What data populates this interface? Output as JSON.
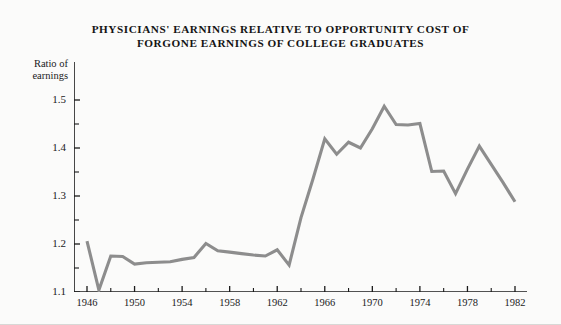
{
  "figure": {
    "background_color": "#fbfbfa",
    "line_color": "#8d8d8d",
    "axis_color": "#1a1a1a",
    "text_color": "#141414"
  },
  "title": "PHYSICIANS' EARNINGS RELATIVE TO OPPORTUNITY COST OF\nFORGONE EARNINGS OF COLLEGE GRADUATES",
  "y_axis_title": "Ratio of\nearnings",
  "y_ticks": [
    "1.1",
    "1.2",
    "1.3",
    "1.4",
    "1.5"
  ],
  "x_ticks": [
    "1946",
    "1950",
    "1954",
    "1958",
    "1962",
    "1966",
    "1970",
    "1974",
    "1978",
    "1982"
  ],
  "chart_data": {
    "type": "line",
    "title": "PHYSICIANS' EARNINGS RELATIVE TO OPPORTUNITY COST OF FORGONE EARNINGS OF COLLEGE GRADUATES",
    "subtitle": "",
    "xlabel": "",
    "ylabel": "Ratio of earnings",
    "xlim": [
      1945.5,
      1982.5
    ],
    "ylim": [
      1.1,
      1.53
    ],
    "grid": false,
    "legend": false,
    "y_major_ticks": [
      1.1,
      1.2,
      1.3,
      1.4,
      1.5
    ],
    "y_minor_ticks": [
      1.15,
      1.25,
      1.35,
      1.45
    ],
    "x_major_ticks": [
      1946,
      1950,
      1954,
      1958,
      1962,
      1966,
      1970,
      1974,
      1978,
      1982
    ],
    "x_minor_ticks": [
      1948,
      1952,
      1956,
      1960,
      1964,
      1968,
      1972,
      1976,
      1980
    ],
    "series": [
      {
        "name": "Ratio of physicians' earnings to opportunity cost",
        "color": "#8d8d8d",
        "x": [
          1946,
          1947,
          1948,
          1949,
          1950,
          1951,
          1952,
          1953,
          1954,
          1955,
          1956,
          1957,
          1958,
          1959,
          1960,
          1961,
          1962,
          1963,
          1964,
          1965,
          1966,
          1967,
          1968,
          1969,
          1970,
          1971,
          1972,
          1973,
          1974,
          1975,
          1976,
          1977,
          1978,
          1979,
          1980,
          1981,
          1982
        ],
        "values": [
          1.206,
          1.104,
          1.175,
          1.174,
          1.158,
          1.161,
          1.162,
          1.163,
          1.168,
          1.172,
          1.201,
          1.186,
          1.183,
          1.18,
          1.177,
          1.175,
          1.188,
          1.156,
          1.255,
          1.335,
          1.419,
          1.387,
          1.412,
          1.4,
          1.44,
          1.487,
          1.449,
          1.448,
          1.451,
          1.351,
          1.352,
          1.305,
          1.356,
          1.404,
          1.366,
          1.328,
          1.288
        ]
      }
    ]
  }
}
